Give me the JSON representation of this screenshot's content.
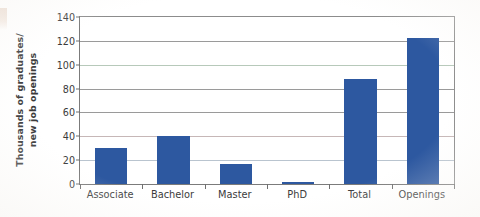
{
  "chart_data": {
    "type": "bar",
    "title": "",
    "subtitle": "",
    "xlabel": "",
    "ylabel": "Thousands of graduates/ new job openings",
    "ylabel_line1": "Thousands of graduates/",
    "ylabel_line2": "new job openings",
    "categories": [
      "Associate",
      "Bachelor",
      "Master",
      "PhD",
      "Total",
      "Openings"
    ],
    "values": [
      30,
      40,
      17,
      1.5,
      88,
      122
    ],
    "series": [
      {
        "name": "Thousands of graduates / new job openings",
        "color": "#2d58a0",
        "values": [
          30,
          40,
          17,
          1.5,
          88,
          122
        ]
      }
    ],
    "ylim": [
      0,
      140
    ],
    "yticks": [
      0,
      20,
      40,
      60,
      80,
      100,
      120,
      140
    ],
    "ytick_labels": [
      "0",
      "20",
      "40",
      "60",
      "80",
      "100",
      "120",
      "140"
    ],
    "grid": true,
    "grid_axis": "y",
    "legend": false,
    "legend_position": "none",
    "bar_color": "#2d58a0",
    "axis_color": "#7b7b7b",
    "grid_color": "#9a9a9a",
    "background": "#ffffff",
    "annotations": []
  }
}
